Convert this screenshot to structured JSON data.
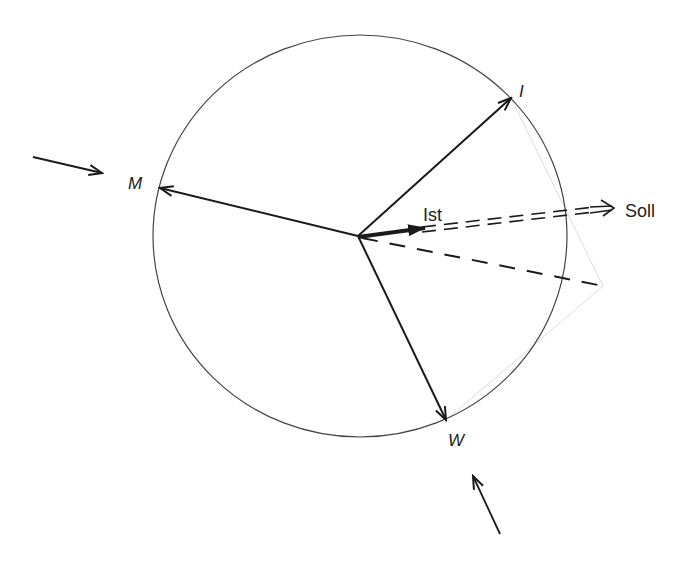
{
  "diagram": {
    "type": "vector-diagram",
    "colors": {
      "ink": "#1a1a1a",
      "circle": "#444444",
      "construction": "#dcdcdc",
      "background": "#ffffff"
    },
    "circle": {
      "cx": 360,
      "cy": 236,
      "rx": 207,
      "ry": 201
    },
    "origin": {
      "x": 358,
      "y": 236
    },
    "vectors": [
      {
        "id": "M",
        "label": "M",
        "to": {
          "x": 160,
          "y": 188
        },
        "style": "solid"
      },
      {
        "id": "I",
        "label": "I",
        "to": {
          "x": 511,
          "y": 98
        },
        "style": "solid"
      },
      {
        "id": "W",
        "label": "W",
        "to": {
          "x": 446,
          "y": 420
        },
        "style": "solid"
      },
      {
        "id": "Ist",
        "label": "Ist",
        "to": {
          "x": 425,
          "y": 228
        },
        "style": "thick"
      },
      {
        "id": "Soll",
        "label": "Soll",
        "from": {
          "x": 422,
          "y": 230
        },
        "to": {
          "x": 612,
          "y": 208
        },
        "style": "double-dashed"
      },
      {
        "id": "resultant",
        "label": "",
        "to": {
          "x": 603,
          "y": 286
        },
        "style": "dashed"
      }
    ],
    "external_arrows": [
      {
        "id": "left-arrow",
        "from": {
          "x": 33,
          "y": 157
        },
        "to": {
          "x": 102,
          "y": 173
        }
      },
      {
        "id": "bottom-arrow",
        "from": {
          "x": 500,
          "y": 534
        },
        "to": {
          "x": 473,
          "y": 476
        }
      }
    ],
    "labels": {
      "M": "M",
      "I": "I",
      "W": "W",
      "Ist": "Ist",
      "Soll": "Soll"
    }
  }
}
